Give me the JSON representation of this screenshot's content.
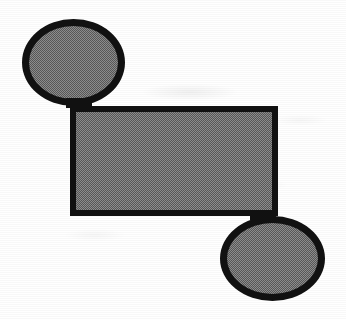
{
  "image": {
    "kind": "scanned-diagram",
    "background_color": "#ffffff",
    "stroke_color": "#111111",
    "fill_color": "#8e8e8e",
    "width": 346,
    "height": 319
  },
  "diagram": {
    "title": "",
    "shapes": [
      {
        "id": "ellipse-top-left",
        "name": "top-left-ellipse",
        "type": "ellipse",
        "label": "",
        "x": 22,
        "y": 19,
        "width": 103,
        "height": 87,
        "border_width": 7,
        "fill": "#8e8e8e",
        "stroke": "#111111"
      },
      {
        "id": "rect-center",
        "name": "center-rectangle",
        "type": "rectangle",
        "label": "",
        "x": 70,
        "y": 106,
        "width": 208,
        "height": 110,
        "border_width": 6,
        "fill": "#8e8e8e",
        "stroke": "#111111"
      },
      {
        "id": "ellipse-bottom-right",
        "name": "bottom-right-ellipse",
        "type": "ellipse",
        "label": "",
        "x": 220,
        "y": 216,
        "width": 105,
        "height": 85,
        "border_width": 7,
        "fill": "#8e8e8e",
        "stroke": "#111111"
      }
    ],
    "connectors": [
      {
        "id": "connector-top",
        "name": "ellipse-to-rectangle-top-connector",
        "from": "ellipse-top-left",
        "to": "rect-center",
        "x": 66,
        "y": 98,
        "width": 26,
        "height": 10
      },
      {
        "id": "connector-bottom",
        "name": "rectangle-to-ellipse-bottom-connector",
        "from": "rect-center",
        "to": "ellipse-bottom-right",
        "x": 250,
        "y": 210,
        "width": 26,
        "height": 10
      }
    ]
  }
}
